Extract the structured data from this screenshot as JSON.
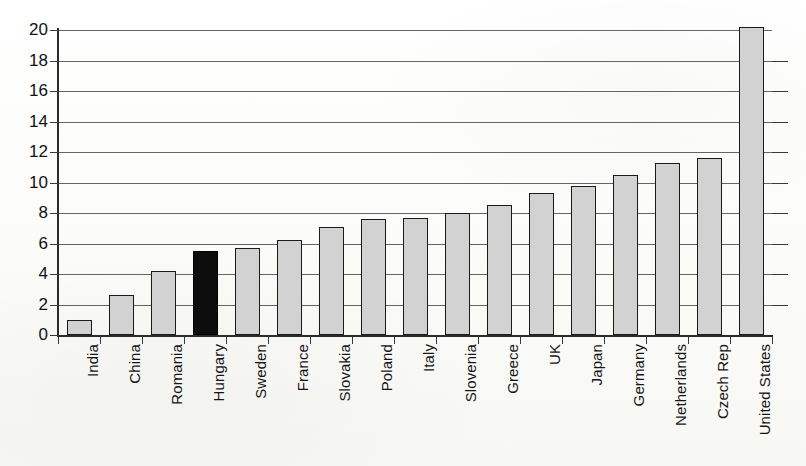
{
  "chart_data": {
    "type": "bar",
    "title": "",
    "subtitle": "",
    "xlabel": "",
    "ylabel": "",
    "ylim": [
      0,
      20
    ],
    "ytick_values": [
      0,
      2,
      4,
      6,
      8,
      10,
      12,
      14,
      16,
      18,
      20
    ],
    "ytick_labels": [
      "0",
      "2",
      "4",
      "6",
      "8",
      "10",
      "12",
      "14",
      "16",
      "18",
      "20"
    ],
    "grid": true,
    "legend": "none",
    "categories": [
      "India",
      "China",
      "Romania",
      "Hungary",
      "Sweden",
      "France",
      "Slovakia",
      "Poland",
      "Italy",
      "Slovenia",
      "Greece",
      "UK",
      "Japan",
      "Germany",
      "Netherlands",
      "Czech Rep",
      "United States"
    ],
    "values": [
      1.0,
      2.6,
      4.2,
      5.5,
      5.7,
      6.2,
      7.1,
      7.6,
      7.65,
      8.0,
      8.5,
      9.3,
      9.8,
      10.5,
      11.3,
      11.6,
      20.2
    ],
    "highlight_category": "Hungary",
    "highlight_index": 3,
    "bar_fill_color": "#d2d2d2",
    "bar_edge_color": "#1a1a1a",
    "highlight_fill_color": "#0d0d0d",
    "grid_color": "#4a4a4a",
    "axis_color": "#2b2b2b"
  }
}
